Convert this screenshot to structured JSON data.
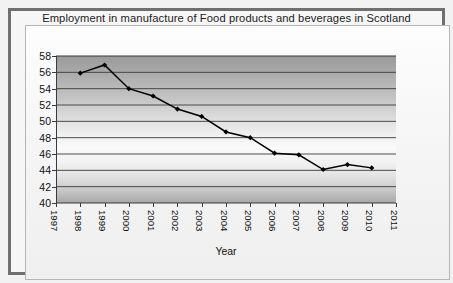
{
  "chart_data": {
    "type": "line",
    "title": "Employment in manufacture of Food products and beverages in Scotland",
    "xlabel": "Year",
    "ylabel": "",
    "xlim": [
      1997,
      2011
    ],
    "ylim": [
      40,
      58
    ],
    "ytick_step": 2,
    "yticks": [
      40,
      42,
      44,
      46,
      48,
      50,
      52,
      54,
      56,
      58
    ],
    "xticks": [
      1997,
      1998,
      1999,
      2000,
      2001,
      2002,
      2003,
      2004,
      2005,
      2006,
      2007,
      2008,
      2009,
      2010,
      2011
    ],
    "xtick_rotation": 90,
    "grid": "horizontal",
    "legend": "none",
    "marker": "diamond",
    "line_color": "#000000",
    "marker_color": "#000000",
    "plot_background": "gray-vertical-gradient",
    "x": [
      1998,
      1999,
      2000,
      2001,
      2002,
      2003,
      2004,
      2005,
      2006,
      2007,
      2008,
      2009,
      2010
    ],
    "values": [
      55.9,
      56.9,
      54.0,
      53.1,
      51.5,
      50.6,
      48.7,
      48.0,
      46.1,
      45.9,
      44.1,
      44.7,
      44.3
    ]
  },
  "frame": {
    "outer_border_color": "#6f6f6f",
    "inner_border_color": "#b5b5b5",
    "page_background": "#f2f2f2"
  }
}
